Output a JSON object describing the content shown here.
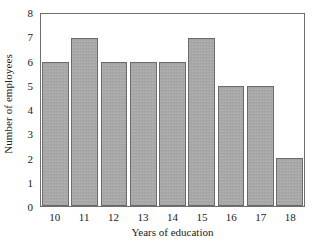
{
  "chart_data": {
    "type": "bar",
    "title": "",
    "xlabel": "Years of education",
    "ylabel": "Number of employees",
    "categories": [
      "10",
      "11",
      "12",
      "13",
      "14",
      "15",
      "16",
      "17",
      "18"
    ],
    "values": [
      6,
      7,
      6,
      6,
      6,
      7,
      5,
      5,
      2
    ],
    "ylim": [
      0,
      8
    ],
    "yticks": [
      "0",
      "1",
      "2",
      "3",
      "4",
      "5",
      "6",
      "7",
      "8"
    ],
    "xticks": [
      "10",
      "11",
      "12",
      "13",
      "14",
      "15",
      "16",
      "17",
      "18"
    ],
    "grid": false,
    "legend": null,
    "bar_color": "#a9a9a9",
    "bar_edge_color": "#6b6b6b",
    "frame_color": "#6e6e6e",
    "background_color": "#ffffff"
  }
}
